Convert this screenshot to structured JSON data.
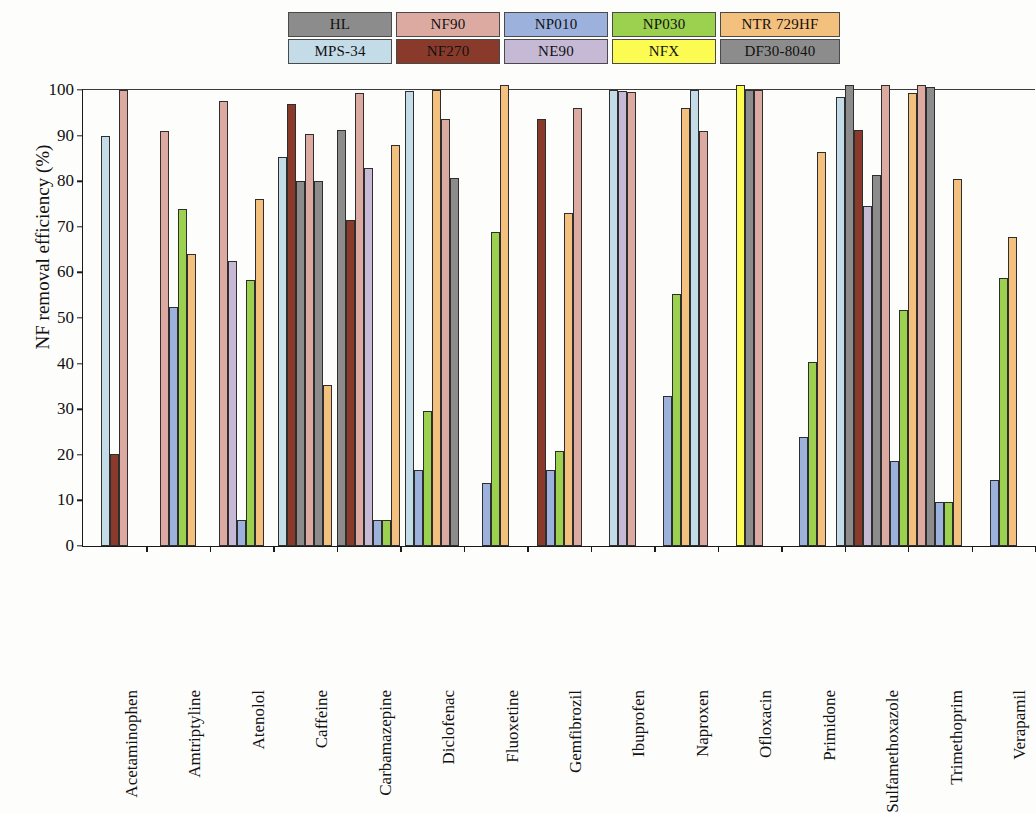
{
  "legend": {
    "rows": [
      [
        {
          "label": "HL",
          "color": "#8c8c8c"
        },
        {
          "label": "NF90",
          "color": "#ddaaa1"
        },
        {
          "label": "NP010",
          "color": "#9cb2dd"
        },
        {
          "label": "NP030",
          "color": "#9cd04f"
        },
        {
          "label": "NTR 729HF",
          "color": "#f4c07e"
        }
      ],
      [
        {
          "label": "MPS-34",
          "color": "#c3dce8"
        },
        {
          "label": "NF270",
          "color": "#8a3a2b"
        },
        {
          "label": "NE90",
          "color": "#c6b9d6"
        },
        {
          "label": "NFX",
          "color": "#fbfb52"
        },
        {
          "label": "DF30-8040",
          "color": "#8c8c8c"
        }
      ]
    ]
  },
  "axis": {
    "ylabel": "NF removal efficiency (%)",
    "yticks": [
      0,
      10,
      20,
      30,
      40,
      50,
      60,
      70,
      80,
      90,
      100
    ]
  },
  "chart_data": {
    "type": "bar",
    "title": "",
    "xlabel": "",
    "ylabel": "NF removal efficiency (%)",
    "ylim": [
      0,
      100
    ],
    "grid": false,
    "legend_position": "top",
    "series_names": [
      "HL",
      "NF90",
      "NP010",
      "NP030",
      "NTR 729HF",
      "MPS-34",
      "NF270",
      "NE90",
      "NFX",
      "DF30-8040"
    ],
    "series_colors": {
      "HL": "#8c8c8c",
      "NF90": "#ddaaa1",
      "NP010": "#9cb2dd",
      "NP030": "#9cd04f",
      "NTR 729HF": "#f4c07e",
      "MPS-34": "#c3dce8",
      "NF270": "#8a3a2b",
      "NE90": "#c6b9d6",
      "NFX": "#fbfb52",
      "DF30-8040": "#8c8c8c"
    },
    "categories": [
      "Acetaminophen",
      "Amtriptyline",
      "Atenolol",
      "Caffeine",
      "Carbamazepine",
      "Diclofenac",
      "Fluoxetine",
      "Gemfibrozil",
      "Ibuprofen",
      "Naproxen",
      "Ofloxacin",
      "Primidone",
      "Sulfamethoxazole",
      "Trimethoprim",
      "Verapamil"
    ],
    "groups": [
      {
        "category": "Acetaminophen",
        "bars": [
          {
            "series": "MPS-34",
            "value": 90
          },
          {
            "series": "NF270",
            "value": 20.2
          },
          {
            "series": "NF90",
            "value": 100
          }
        ]
      },
      {
        "category": "Amtriptyline",
        "bars": [
          {
            "series": "NF90",
            "value": 91
          },
          {
            "series": "NP010",
            "value": 52.4
          },
          {
            "series": "NP030",
            "value": 74
          },
          {
            "series": "NTR 729HF",
            "value": 64
          }
        ]
      },
      {
        "category": "Atenolol",
        "bars": [
          {
            "series": "NF90",
            "value": 97.5
          },
          {
            "series": "NE90",
            "value": 62.4
          },
          {
            "series": "NP010",
            "value": 5.6
          },
          {
            "series": "NP030",
            "value": 58.4
          },
          {
            "series": "NTR 729HF",
            "value": 76
          }
        ]
      },
      {
        "category": "Caffeine",
        "bars": [
          {
            "series": "MPS-34",
            "value": 85.4
          },
          {
            "series": "NF270",
            "value": 97
          },
          {
            "series": "HL",
            "value": 80
          },
          {
            "series": "NF90",
            "value": 90.4
          },
          {
            "series": "DF30-8040",
            "value": 80
          },
          {
            "series": "NTR 729HF",
            "value": 35.3
          }
        ]
      },
      {
        "category": "Carbamazepine",
        "bars": [
          {
            "series": "HL",
            "value": 91.2
          },
          {
            "series": "NF270",
            "value": 71.5
          },
          {
            "series": "NF90",
            "value": 99.3
          },
          {
            "series": "NE90",
            "value": 83
          },
          {
            "series": "NP010",
            "value": 5.8
          },
          {
            "series": "NP030",
            "value": 5.8
          },
          {
            "series": "NTR 729HF",
            "value": 88
          }
        ]
      },
      {
        "category": "Diclofenac",
        "bars": [
          {
            "series": "MPS-34",
            "value": 99.8
          },
          {
            "series": "NP010",
            "value": 16.7
          },
          {
            "series": "NP030",
            "value": 29.5
          },
          {
            "series": "NTR 729HF",
            "value": 100
          },
          {
            "series": "NF90",
            "value": 93.7
          },
          {
            "series": "DF30-8040",
            "value": 80.7
          }
        ]
      },
      {
        "category": "Fluoxetine",
        "bars": [
          {
            "series": "NP010",
            "value": 13.8
          },
          {
            "series": "NP030",
            "value": 68.8
          },
          {
            "series": "NTR 729HF",
            "value": 101
          }
        ]
      },
      {
        "category": "Gemfibrozil",
        "bars": [
          {
            "series": "NF270",
            "value": 93.7
          },
          {
            "series": "NP010",
            "value": 16.7
          },
          {
            "series": "NP030",
            "value": 20.8
          },
          {
            "series": "NTR 729HF",
            "value": 73
          },
          {
            "series": "NF90",
            "value": 96
          }
        ]
      },
      {
        "category": "Ibuprofen",
        "bars": [
          {
            "series": "MPS-34",
            "value": 100
          },
          {
            "series": "NE90",
            "value": 99.8
          },
          {
            "series": "NF90",
            "value": 99.6
          }
        ]
      },
      {
        "category": "Naproxen",
        "bars": [
          {
            "series": "NP010",
            "value": 33
          },
          {
            "series": "NP030",
            "value": 55.3
          },
          {
            "series": "NTR 729HF",
            "value": 96
          },
          {
            "series": "MPS-34",
            "value": 100
          },
          {
            "series": "NF90",
            "value": 91
          }
        ]
      },
      {
        "category": "Ofloxacin",
        "bars": [
          {
            "series": "NFX",
            "value": 101
          },
          {
            "series": "DF30-8040",
            "value": 100
          },
          {
            "series": "NF90",
            "value": 100
          }
        ]
      },
      {
        "category": "Primidone",
        "bars": [
          {
            "series": "NP010",
            "value": 24
          },
          {
            "series": "NP030",
            "value": 40.3
          },
          {
            "series": "NTR 729HF",
            "value": 86.5
          }
        ]
      },
      {
        "category": "Sulfamethoxazole",
        "bars": [
          {
            "series": "MPS-34",
            "value": 98.5
          },
          {
            "series": "HL",
            "value": 101
          },
          {
            "series": "NF270",
            "value": 91.3
          },
          {
            "series": "NE90",
            "value": 74.5
          },
          {
            "series": "DF30-8040",
            "value": 81.3
          },
          {
            "series": "NF90",
            "value": 101
          },
          {
            "series": "NP010",
            "value": 18.7
          },
          {
            "series": "NP030",
            "value": 51.7
          },
          {
            "series": "NTR 729HF",
            "value": 99.3
          }
        ]
      },
      {
        "category": "Trimethoprim",
        "bars": [
          {
            "series": "NF90",
            "value": 101
          },
          {
            "series": "DF30-8040",
            "value": 100.7
          },
          {
            "series": "NP010",
            "value": 9.7
          },
          {
            "series": "NP030",
            "value": 9.7
          },
          {
            "series": "NTR 729HF",
            "value": 80.5
          }
        ]
      },
      {
        "category": "Verapamil",
        "bars": [
          {
            "series": "NP010",
            "value": 14.5
          },
          {
            "series": "NP030",
            "value": 58.7
          },
          {
            "series": "NTR 729HF",
            "value": 67.7
          }
        ]
      }
    ]
  }
}
